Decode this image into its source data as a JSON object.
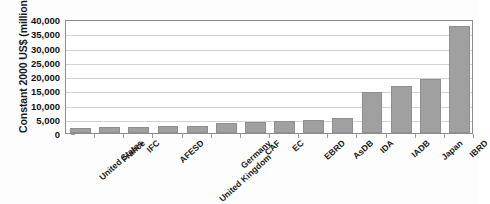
{
  "chart_data": {
    "type": "bar",
    "title": "",
    "xlabel": "",
    "ylabel": "Constant 2000 US$ (millions)",
    "ylim": [
      0,
      40000
    ],
    "ytick_step": 5000,
    "grid": true,
    "legend": "none",
    "bar_color": "#a0a0a0",
    "categories": [
      "United States",
      "France",
      "IFC",
      "AFESD",
      "United Kingdom",
      "Germany",
      "CAF",
      "EC",
      "EBRD",
      "AsDB",
      "IDA",
      "IADB",
      "Japan",
      "IBRD"
    ],
    "values": [
      1700,
      2000,
      2100,
      2300,
      2500,
      3500,
      3700,
      4100,
      4700,
      5200,
      14500,
      16500,
      19000,
      37500
    ],
    "ytick_labels": [
      "40,000",
      "35,000",
      "30,000",
      "25,000",
      "20,000",
      "15,000",
      "10,000",
      "5,000",
      "0"
    ],
    "ytick_values": [
      40000,
      35000,
      30000,
      25000,
      20000,
      15000,
      10000,
      5000,
      0
    ]
  }
}
